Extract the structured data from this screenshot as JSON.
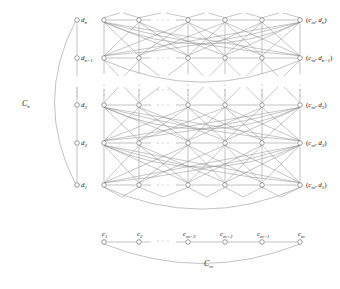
{
  "figure": {
    "title_alt": "Categorical product of cycles diagram",
    "background_color": "#ffffff",
    "edge_color": "#8f8f8f",
    "node_stroke_color": "#6f6f6f",
    "node_fill_color": "#ffffff",
    "label_color": "#1a1a1a",
    "width": 340,
    "height": 289
  },
  "left_cycle": {
    "name": "C_n",
    "label": "C",
    "label_sub": "n",
    "label_x": 22,
    "label_y": 106,
    "vertex_x": 77,
    "arc_control_x": 34,
    "ellipsis_x": 77,
    "ellipsis_ys": [
      88,
      92,
      96
    ],
    "vertices": [
      {
        "id": "dn",
        "base": "d",
        "sub": "n",
        "y": 20,
        "label_dx": 4,
        "label_dy": 2
      },
      {
        "id": "dn-1",
        "base": "d",
        "sub": "n−1",
        "y": 58,
        "label_dx": 4,
        "label_dy": 2
      },
      {
        "id": "d3",
        "base": "d",
        "sub": "3",
        "y": 105,
        "label_dx": 4,
        "label_dy": 2
      },
      {
        "id": "d2",
        "base": "d",
        "sub": "2",
        "y": 143,
        "label_dx": 4,
        "label_dy": 2
      },
      {
        "id": "d1",
        "base": "d",
        "sub": "1",
        "y": 185,
        "label_dx": 4,
        "label_dy": 2
      }
    ]
  },
  "bottom_cycle": {
    "name": "C_m",
    "label": "C",
    "label_sub": "m",
    "label_x": 204,
    "label_y": 266,
    "vertex_y": 242,
    "arc_control_y": 283,
    "ellipsis_y": 241,
    "ellipsis_xs": [
      158,
      163,
      168
    ],
    "vertices": [
      {
        "id": "c1",
        "base": "c",
        "sub": "1",
        "x": 104,
        "label_dx": -2,
        "label_dy": -6
      },
      {
        "id": "c2",
        "base": "c",
        "sub": "2",
        "x": 139,
        "label_dx": -2,
        "label_dy": -6
      },
      {
        "id": "cm-3",
        "base": "c",
        "sub": "m−3",
        "x": 188,
        "label_dx": -5,
        "label_dy": -6
      },
      {
        "id": "cm-2",
        "base": "c",
        "sub": "m−2",
        "x": 225,
        "label_dx": -5,
        "label_dy": -6
      },
      {
        "id": "cm-1",
        "base": "c",
        "sub": "m−1",
        "x": 262,
        "label_dx": -5,
        "label_dy": -6
      },
      {
        "id": "cm",
        "base": "c",
        "sub": "m",
        "x": 300,
        "label_dx": -2,
        "label_dy": -6
      }
    ]
  },
  "product_grid": {
    "description": "Product graph of C_m and C_n",
    "columns_x": [
      104,
      139,
      188,
      225,
      262,
      300
    ],
    "rows_y": [
      20,
      58,
      105,
      143,
      185
    ],
    "column_ellipsis_x": [
      158,
      163,
      168
    ],
    "row_ellipsis_y": [
      85,
      90,
      95
    ],
    "row_arc_offset": 46,
    "col_gap_index": 1,
    "row_gap_index": 1,
    "row_labels": [
      {
        "row": 0,
        "prefix": "(",
        "c_base": "c",
        "c_sub": "m",
        "sep": ", ",
        "d_base": "d",
        "d_sub": "n",
        "suffix": ")"
      },
      {
        "row": 1,
        "prefix": "(",
        "c_base": "c",
        "c_sub": "m",
        "sep": ", ",
        "d_base": "d",
        "d_sub": "n−1",
        "suffix": ")"
      },
      {
        "row": 2,
        "prefix": "(",
        "c_base": "c",
        "c_sub": "m",
        "sep": ", ",
        "d_base": "d",
        "d_sub": "3",
        "suffix": ")"
      },
      {
        "row": 3,
        "prefix": "(",
        "c_base": "c",
        "c_sub": "m",
        "sep": ", ",
        "d_base": "d",
        "d_sub": "2",
        "suffix": ")"
      },
      {
        "row": 4,
        "prefix": "(",
        "c_base": "c",
        "c_sub": "m",
        "sep": ", ",
        "d_base": "d",
        "d_sub": "1",
        "suffix": ")"
      }
    ],
    "row_ellipsis_label_x": 310,
    "node_radius": 2.3
  }
}
